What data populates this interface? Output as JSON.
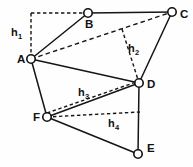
{
  "figure": {
    "type": "geometric-diagram",
    "background_color": "#fefefe",
    "stroke_color": "#151515",
    "vertex_fill": "#ffffff"
  },
  "vertices": [
    {
      "id": "A",
      "label": "A",
      "x": 31,
      "y": 59,
      "r": 4.2,
      "label_x": 17,
      "label_y": 54
    },
    {
      "id": "B",
      "label": "B",
      "x": 88,
      "y": 13,
      "r": 4.2,
      "label_x": 85,
      "label_y": 19
    },
    {
      "id": "C",
      "label": "C",
      "x": 172,
      "y": 12,
      "r": 4.2,
      "label_x": 180,
      "label_y": 9
    },
    {
      "id": "D",
      "label": "D",
      "x": 139,
      "y": 83,
      "r": 4.2,
      "label_x": 147,
      "label_y": 79
    },
    {
      "id": "E",
      "label": "E",
      "x": 138,
      "y": 154,
      "r": 4.2,
      "label_x": 147,
      "label_y": 143
    },
    {
      "id": "F",
      "label": "F",
      "x": 47,
      "y": 117,
      "r": 4.2,
      "label_x": 33,
      "label_y": 112
    }
  ],
  "solid_edges": [
    {
      "name": "edge-a-b",
      "from": "A",
      "to": "B",
      "x1": 31,
      "y1": 59,
      "x2": 88,
      "y2": 13
    },
    {
      "name": "edge-b-c",
      "from": "B",
      "to": "C",
      "x1": 88,
      "y1": 13,
      "x2": 172,
      "y2": 12
    },
    {
      "name": "edge-c-d",
      "from": "C",
      "to": "D",
      "x1": 172,
      "y1": 12,
      "x2": 139,
      "y2": 83
    },
    {
      "name": "edge-d-e",
      "from": "D",
      "to": "E",
      "x1": 139,
      "y1": 83,
      "x2": 138,
      "y2": 154
    },
    {
      "name": "edge-e-f",
      "from": "E",
      "to": "F",
      "x1": 138,
      "y1": 154,
      "x2": 47,
      "y2": 117
    },
    {
      "name": "edge-f-a",
      "from": "F",
      "to": "A",
      "x1": 47,
      "y1": 117,
      "x2": 31,
      "y2": 59
    },
    {
      "name": "edge-a-d",
      "from": "A",
      "to": "D",
      "x1": 31,
      "y1": 59,
      "x2": 139,
      "y2": 83
    },
    {
      "name": "edge-f-d",
      "from": "F",
      "to": "D",
      "x1": 47,
      "y1": 117,
      "x2": 139,
      "y2": 83
    }
  ],
  "dashed_edges": [
    {
      "name": "diagonal-a-c",
      "from": "A",
      "to": "C",
      "x1": 31,
      "y1": 59,
      "x2": 172,
      "y2": 12
    },
    {
      "name": "height-h1-vertical",
      "x1": 31,
      "y1": 13,
      "x2": 31,
      "y2": 59
    },
    {
      "name": "height-h1-horizontal",
      "x1": 31,
      "y1": 13,
      "x2": 88,
      "y2": 13
    },
    {
      "name": "height-h2",
      "x1": 122,
      "y1": 29,
      "x2": 139,
      "y2": 83
    },
    {
      "name": "height-h3",
      "x1": 47,
      "y1": 113,
      "x2": 139,
      "y2": 81
    },
    {
      "name": "height-h4",
      "x1": 47,
      "y1": 117,
      "x2": 140,
      "y2": 112
    }
  ],
  "height_labels": [
    {
      "id": "h1",
      "text": "h",
      "sub": "1",
      "x": 11,
      "y": 27
    },
    {
      "id": "h2",
      "text": "h",
      "sub": "2",
      "x": 128,
      "y": 43
    },
    {
      "id": "h3",
      "text": "h",
      "sub": "3",
      "x": 78,
      "y": 87
    },
    {
      "id": "h4",
      "text": "h",
      "sub": "4",
      "x": 108,
      "y": 118
    }
  ]
}
